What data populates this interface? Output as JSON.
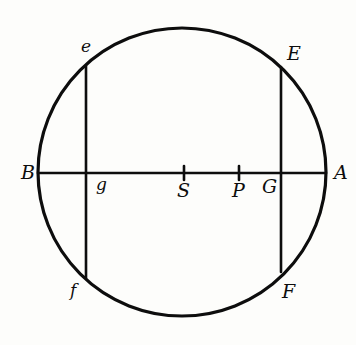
{
  "figure": {
    "background_color": "#fdfdfb",
    "ink_color": "#0d0d0d",
    "canvas": {
      "width": 356,
      "height": 345
    }
  },
  "chart_data": {
    "type": "diagram",
    "xlabel": "",
    "ylabel": "",
    "shapes": [
      {
        "name": "main-circle",
        "kind": "circle",
        "cx": 182,
        "cy": 172,
        "r": 144,
        "stroke_width": 3.2,
        "filled": false
      },
      {
        "name": "diameter-BA",
        "kind": "line",
        "x1": 38,
        "y1": 173,
        "x2": 326,
        "y2": 173,
        "stroke_width": 2.6,
        "endpoints": [
          "B",
          "A"
        ]
      },
      {
        "name": "chord-ef",
        "kind": "line",
        "x1": 86,
        "y1": 66,
        "x2": 86,
        "y2": 278,
        "stroke_width": 2.6,
        "endpoints": [
          "e",
          "f"
        ]
      },
      {
        "name": "chord-EF",
        "kind": "line",
        "x1": 281,
        "y1": 67,
        "x2": 281,
        "y2": 272,
        "stroke_width": 2.6,
        "endpoints": [
          "E",
          "F"
        ]
      }
    ],
    "tick_marks": [
      {
        "name": "tick-S",
        "x": 184,
        "y": 173,
        "half_height": 7,
        "stroke_width": 2.6
      },
      {
        "name": "tick-P",
        "x": 239,
        "y": 173,
        "half_height": 7,
        "stroke_width": 2.6
      }
    ],
    "points": [
      {
        "id": "B",
        "label": "B",
        "x": 38,
        "y": 173,
        "label_x": 21,
        "label_y": 163,
        "size": "major",
        "note": "left end of diameter on circle"
      },
      {
        "id": "A",
        "label": "A",
        "x": 326,
        "y": 173,
        "label_x": 334,
        "label_y": 163,
        "size": "major",
        "note": "right end of diameter on circle"
      },
      {
        "id": "e",
        "label": "e",
        "x": 86,
        "y": 66,
        "label_x": 81,
        "label_y": 38,
        "size": "minor",
        "note": "upper end of left chord"
      },
      {
        "id": "E",
        "label": "E",
        "x": 281,
        "y": 67,
        "label_x": 287,
        "label_y": 44,
        "size": "major",
        "note": "upper end of right chord"
      },
      {
        "id": "f",
        "label": "f",
        "x": 86,
        "y": 278,
        "label_x": 70,
        "label_y": 282,
        "size": "minor",
        "note": "lower end of left chord"
      },
      {
        "id": "F",
        "label": "F",
        "x": 281,
        "y": 272,
        "label_x": 282,
        "label_y": 282,
        "size": "major",
        "note": "lower end of right chord"
      },
      {
        "id": "g",
        "label": "g",
        "x": 86,
        "y": 173,
        "label_x": 96,
        "label_y": 176,
        "size": "minor",
        "note": "intersection of left chord and diameter"
      },
      {
        "id": "S",
        "label": "S",
        "x": 184,
        "y": 173,
        "label_x": 177,
        "label_y": 181,
        "size": "major",
        "note": "tick point left of P"
      },
      {
        "id": "P",
        "label": "P",
        "x": 239,
        "y": 173,
        "label_x": 232,
        "label_y": 181,
        "size": "major",
        "note": "tick point right of S"
      },
      {
        "id": "G",
        "label": "G",
        "x": 281,
        "y": 173,
        "label_x": 262,
        "label_y": 177,
        "size": "major",
        "note": "intersection of right chord and diameter"
      }
    ]
  }
}
